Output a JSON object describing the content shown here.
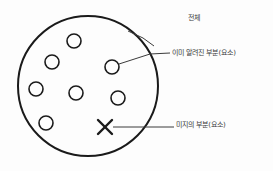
{
  "diagram": {
    "type": "venn-like-set-diagram",
    "background_color": "#fdfdfd",
    "stroke_color": "#1a1a1a",
    "leader_color": "#3b3b3b",
    "text_color": "#3a3a3a",
    "main_set": {
      "name": "whole-set-circle",
      "cx": 88,
      "cy": 86,
      "r": 70,
      "stroke_width": 2.0
    },
    "known_elements": {
      "name": "known-element-circles",
      "count": 7,
      "radius": 7,
      "stroke_width": 1.6,
      "positions": [
        {
          "cx": 74,
          "cy": 41
        },
        {
          "cx": 52,
          "cy": 62
        },
        {
          "cx": 112,
          "cy": 67
        },
        {
          "cx": 36,
          "cy": 89
        },
        {
          "cx": 76,
          "cy": 93
        },
        {
          "cx": 118,
          "cy": 98
        },
        {
          "cx": 46,
          "cy": 123
        }
      ]
    },
    "unknown_element": {
      "name": "unknown-element-x-mark",
      "cx": 105,
      "cy": 127,
      "size": 7,
      "stroke_width": 2.4
    },
    "leaders": [
      {
        "name": "leader-line-whole",
        "points": "128,31 143,38 154,46",
        "target_label": "전체"
      },
      {
        "name": "leader-line-known",
        "points": "119,64 150,54 170,53",
        "target_label": "이미 알려진 부분(요소)"
      },
      {
        "name": "leader-line-unknown",
        "points": "113,127 174,127",
        "target_label": "미지의 부분(요소)"
      }
    ]
  },
  "labels": {
    "whole": "전체",
    "known": "이미 알려진 부분(요소)",
    "unknown": "미지의 부분(요소)"
  }
}
